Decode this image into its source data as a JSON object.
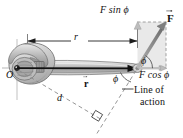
{
  "figure": {
    "labels": {
      "force_vector": "F",
      "force_sin_component": "F sin ϕ",
      "force_cos_component": "F cos ϕ",
      "radius_dimension": "r",
      "position_vector": "r",
      "moment_arm": "d",
      "pivot": "O",
      "angle_at_head": "ϕ",
      "angle_below_handle": "ϕ",
      "line_of_action_1": "Line of",
      "line_of_action_2": "action"
    },
    "colors": {
      "ink": "#111111",
      "wrench_fill": "#c9c9c9",
      "wrench_stroke": "#6b6b6b",
      "wrench_light": "#e3e3e3",
      "wrench_dark": "#9a9a9a",
      "shaded_rect": "#e8e8e8",
      "component_arrow": "#b5b5b5",
      "force_arrow": "#8a8a8a",
      "dashed": "#8f8f8f",
      "axis": "#8f8f8f",
      "background": "#ffffff"
    },
    "geometry": {
      "pivot_x": 28,
      "pivot_y": 68,
      "head_x": 137,
      "head_y": 68,
      "force_tip_x": 166,
      "force_tip_y": 22,
      "rect_left": 137,
      "rect_top": 22,
      "rect_right": 166,
      "rect_bottom": 68,
      "angle_phi_deg": 58
    }
  }
}
